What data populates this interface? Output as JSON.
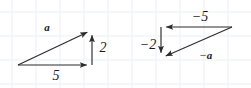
{
  "figure": {
    "width": 251,
    "height": 88,
    "background_color": "#ffffff",
    "grid": {
      "visible": true,
      "color": "#eceff1",
      "spacing_px": 24
    },
    "stroke_color": "#2b2b2b",
    "text_color": "#1a1a1a"
  },
  "diagrams": [
    {
      "id": "vector-a-triangle",
      "name": "positive-vector-triangle",
      "vertices": {
        "origin": [
          18,
          65
        ],
        "corner": [
          92,
          65
        ],
        "tip": [
          92,
          30
        ]
      },
      "arrows": [
        {
          "name": "vector-a-arrow",
          "from": [
            18,
            65
          ],
          "to": [
            92,
            30
          ],
          "label": "a",
          "label_pos": [
            47,
            27
          ],
          "label_kind": "vector"
        },
        {
          "name": "horizontal-component-arrow",
          "from": [
            18,
            65
          ],
          "to": [
            92,
            65
          ],
          "label": "5",
          "label_pos": [
            56,
            76
          ],
          "label_kind": "number"
        },
        {
          "name": "vertical-component-arrow",
          "from": [
            92,
            65
          ],
          "to": [
            92,
            30
          ],
          "label": "2",
          "label_pos": [
            103,
            48
          ],
          "label_kind": "number"
        }
      ]
    },
    {
      "id": "vector-neg-a-triangle",
      "name": "negative-vector-triangle",
      "vertices": {
        "origin": [
          232,
          27
        ],
        "corner": [
          161,
          27
        ],
        "tip": [
          161,
          58
        ]
      },
      "arrows": [
        {
          "name": "horizontal-component-arrow",
          "from": [
            232,
            27
          ],
          "to": [
            161,
            27
          ],
          "label": "−5",
          "label_pos": [
            200,
            17
          ],
          "label_kind": "number"
        },
        {
          "name": "vertical-component-arrow",
          "from": [
            161,
            27
          ],
          "to": [
            161,
            58
          ],
          "label": "−2",
          "label_pos": [
            148,
            45
          ],
          "label_kind": "number"
        },
        {
          "name": "vector-neg-a-arrow",
          "from": [
            232,
            27
          ],
          "to": [
            161,
            58
          ],
          "label_sign": "−",
          "label_vec": "a",
          "label_pos": [
            206,
            55
          ],
          "label_kind": "signed-vector"
        }
      ]
    }
  ],
  "labels": {
    "vector_a": "a",
    "component_x": "5",
    "component_y": "2",
    "neg_component_x": "−5",
    "neg_component_y": "−2",
    "neg_vector_sign": "−",
    "neg_vector_name": "a"
  },
  "chart_data": {
    "type": "scatter",
    "xlabel": "",
    "ylabel": "",
    "series": [
      {
        "name": "a",
        "components": [
          5,
          2
        ],
        "label": "a",
        "component_labels": [
          "5",
          "2"
        ]
      },
      {
        "name": "-a",
        "components": [
          -5,
          -2
        ],
        "label": "−a",
        "component_labels": [
          "−5",
          "−2"
        ]
      }
    ]
  }
}
